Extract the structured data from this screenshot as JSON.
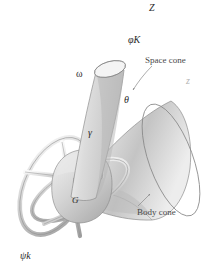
{
  "figure": {
    "background_color": "#ffffff",
    "line_color": "#6e6e6e",
    "surface_color": "#c8c8c8",
    "text_color": "#2a2a2a"
  },
  "labels": {
    "axis_Z": "Z",
    "axis_z": "z",
    "precession_vector": "φK",
    "spin_vector": "ψk",
    "angular_velocity": "ω",
    "angle_theta": "θ",
    "angle_gamma": "γ",
    "center_of_mass": "G",
    "space_cone": "Space cone",
    "body_cone": "Body cone"
  },
  "elements": {
    "space_cone_name": "space-cone",
    "body_cone_name": "body-cone",
    "gimbal_name": "gimbal-rings",
    "rotor_name": "rotor-body"
  }
}
